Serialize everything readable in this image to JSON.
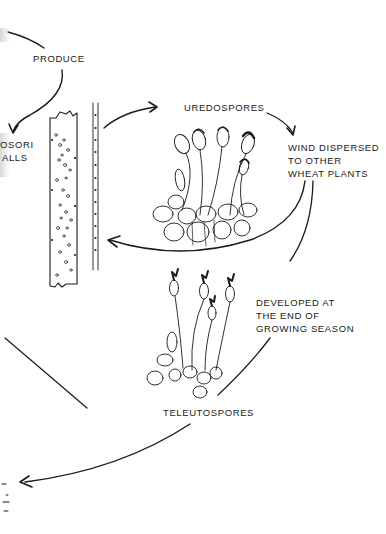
{
  "diagram": {
    "type": "life-cycle",
    "labels": {
      "produce": "PRODUCE",
      "pycniosori_partial": "OSORI",
      "walls_partial": "ALLS",
      "uredospores": "UREDOSPORES",
      "wind_line1": "WIND DISPERSED",
      "wind_line2": "TO OTHER",
      "wind_line3": "WHEAT PLANTS",
      "developed_line1": "DEVELOPED AT",
      "developed_line2": "THE END OF",
      "developed_line3": "GROWING SEASON",
      "teleutospores": "TELEUTOSPORES"
    },
    "nodes": [
      {
        "id": "wheat-stem-section",
        "kind": "illustration"
      },
      {
        "id": "uredospores-cluster",
        "kind": "illustration"
      },
      {
        "id": "teleutospores-cluster",
        "kind": "illustration"
      }
    ],
    "edges": [
      {
        "from": "offscreen-left",
        "to": "produce",
        "arrow": false
      },
      {
        "from": "produce",
        "to": "pycniosori",
        "arrow": true
      },
      {
        "from": "wheat-stem-section",
        "to": "uredospores",
        "arrow": true
      },
      {
        "from": "uredospores",
        "to": "wind-dispersed",
        "arrow": true
      },
      {
        "from": "wind-dispersed",
        "to": "wheat-stem-section",
        "arrow": true
      },
      {
        "from": "wind-dispersed",
        "to": "developed-at-end",
        "arrow": false
      },
      {
        "from": "developed-at-end",
        "to": "teleutospores",
        "arrow": false
      },
      {
        "from": "teleutospores",
        "to": "offscreen-left",
        "arrow": true
      }
    ],
    "colors": {
      "ink": "#1a1a1a",
      "background": "#ffffff"
    }
  }
}
